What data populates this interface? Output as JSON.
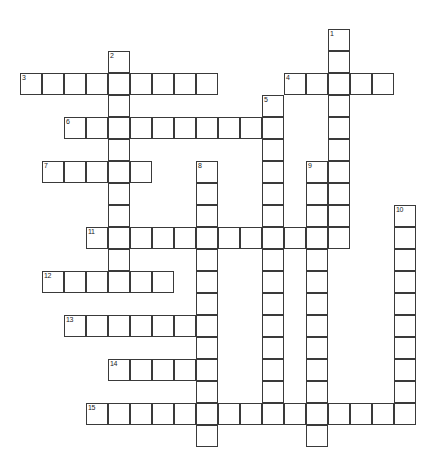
{
  "puzzle": {
    "kind": "crossword-grid",
    "title": "",
    "cell_size_px": 22,
    "origin": {
      "x": 20,
      "y": 29
    },
    "grid_columns": 18,
    "grid_rows": 20,
    "colors": {
      "background": "#ffffff",
      "cell_fill": "#ffffff",
      "cell_border": "#3a3a3a",
      "number_text": "#1a1a1a"
    },
    "entries": [
      {
        "number": "1",
        "direction": "down",
        "col": 14,
        "row": 0,
        "length": 10
      },
      {
        "number": "2",
        "direction": "down",
        "col": 4,
        "row": 1,
        "length": 11
      },
      {
        "number": "3",
        "direction": "across",
        "col": 0,
        "row": 2,
        "length": 9
      },
      {
        "number": "4",
        "direction": "across",
        "col": 12,
        "row": 2,
        "length": 5
      },
      {
        "number": "5",
        "direction": "down",
        "col": 11,
        "row": 3,
        "length": 15
      },
      {
        "number": "6",
        "direction": "across",
        "col": 2,
        "row": 4,
        "length": 10
      },
      {
        "number": "7",
        "direction": "across",
        "col": 1,
        "row": 6,
        "length": 5
      },
      {
        "number": "8",
        "direction": "down",
        "col": 8,
        "row": 6,
        "length": 13
      },
      {
        "number": "9",
        "direction": "down",
        "col": 13,
        "row": 6,
        "length": 13
      },
      {
        "number": "10",
        "direction": "down",
        "col": 17,
        "row": 8,
        "length": 10
      },
      {
        "number": "11",
        "direction": "across",
        "col": 3,
        "row": 9,
        "length": 12
      },
      {
        "number": "12",
        "direction": "across",
        "col": 1,
        "row": 11,
        "length": 6
      },
      {
        "number": "13",
        "direction": "across",
        "col": 2,
        "row": 13,
        "length": 7
      },
      {
        "number": "14",
        "direction": "across",
        "col": 4,
        "row": 15,
        "length": 4
      },
      {
        "number": "15",
        "direction": "across",
        "col": 3,
        "row": 17,
        "length": 15
      }
    ],
    "numbered_cells": [
      {
        "number": "1",
        "col": 14,
        "row": 0
      },
      {
        "number": "2",
        "col": 4,
        "row": 1
      },
      {
        "number": "3",
        "col": 0,
        "row": 2
      },
      {
        "number": "4",
        "col": 12,
        "row": 2
      },
      {
        "number": "5",
        "col": 11,
        "row": 3
      },
      {
        "number": "6",
        "col": 2,
        "row": 4
      },
      {
        "number": "7",
        "col": 1,
        "row": 6
      },
      {
        "number": "8",
        "col": 8,
        "row": 6
      },
      {
        "number": "9",
        "col": 13,
        "row": 6
      },
      {
        "number": "10",
        "col": 17,
        "row": 8
      },
      {
        "number": "11",
        "col": 3,
        "row": 9
      },
      {
        "number": "12",
        "col": 1,
        "row": 11
      },
      {
        "number": "13",
        "col": 2,
        "row": 13
      },
      {
        "number": "14",
        "col": 4,
        "row": 15
      },
      {
        "number": "15",
        "col": 3,
        "row": 17
      }
    ],
    "letters": []
  }
}
